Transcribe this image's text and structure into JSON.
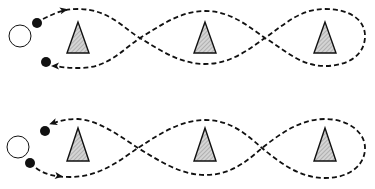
{
  "diagram": {
    "type": "weave-drill",
    "colors": {
      "line": "#111111",
      "cone_fill": "#d4d4d4",
      "cone_stroke": "#111111",
      "player": "#111111",
      "start_marker": "#ffffff",
      "background": "#ffffff"
    },
    "panels": [
      {
        "id": "top",
        "start_marker": {
          "cx": 20,
          "cy": 36,
          "r": 11
        },
        "players": [
          {
            "cx": 37,
            "cy": 23,
            "r": 5
          },
          {
            "cx": 46,
            "cy": 62,
            "r": 5
          }
        ],
        "cones": [
          {
            "cx": 78,
            "top": 22,
            "base": 53,
            "half_width": 11
          },
          {
            "cx": 205,
            "top": 22,
            "base": 53,
            "half_width": 11
          },
          {
            "cx": 325,
            "top": 22,
            "base": 53,
            "half_width": 11
          }
        ],
        "path": "M 43 19 C 55 13, 64 9, 78 9 C 110 9, 125 30, 140 38 C 160 50, 180 64, 205 64 C 232 64, 250 48, 265 38 C 285 24, 300 9, 325 9 C 350 9, 365 20, 365 36 C 365 55, 348 66, 325 66 C 300 66, 285 50, 265 38 C 250 28, 232 11, 205 11 C 180 11, 160 26, 140 38 C 122 50, 108 68, 80 68 C 72 68, 64 68, 56 66",
        "arrows": [
          {
            "x": 64,
            "y": 10,
            "angle": -12
          },
          {
            "x": 55,
            "y": 66,
            "angle": 180
          }
        ]
      },
      {
        "id": "bottom",
        "start_marker": {
          "cx": 18,
          "cy": 147,
          "r": 11
        },
        "players": [
          {
            "cx": 45,
            "cy": 131,
            "r": 5
          },
          {
            "cx": 30,
            "cy": 163,
            "r": 5
          }
        ],
        "cones": [
          {
            "cx": 78,
            "top": 128,
            "base": 161,
            "half_width": 11
          },
          {
            "cx": 205,
            "top": 128,
            "base": 161,
            "half_width": 11
          },
          {
            "cx": 325,
            "top": 128,
            "base": 161,
            "half_width": 11
          }
        ],
        "path": "M 36 168 C 44 174, 54 177, 70 177 C 100 177, 120 160, 138 148 C 158 135, 180 120, 205 120 C 232 120, 248 136, 262 148 C 280 163, 300 178, 325 178 C 350 178, 365 165, 365 148 C 365 132, 348 119, 325 119 C 300 119, 280 134, 262 148 C 248 160, 232 175, 205 175 C 180 175, 158 160, 138 148 C 120 136, 98 120, 78 119 C 68 119, 60 120, 52 124",
        "arrows": [
          {
            "x": 59,
            "y": 176,
            "angle": 8
          },
          {
            "x": 53,
            "y": 123,
            "angle": 160
          }
        ]
      }
    ]
  }
}
